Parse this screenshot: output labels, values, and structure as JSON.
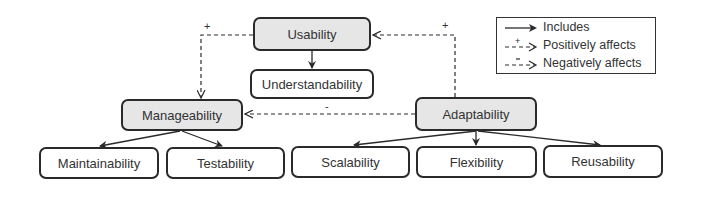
{
  "nodes": {
    "usability": {
      "label": "Usability",
      "filled": true
    },
    "understandability": {
      "label": "Understandability",
      "filled": false
    },
    "manageability": {
      "label": "Manageability",
      "filled": true
    },
    "adaptability": {
      "label": "Adaptability",
      "filled": true
    },
    "maintainability": {
      "label": "Maintainability",
      "filled": false
    },
    "testability": {
      "label": "Testability",
      "filled": false
    },
    "scalability": {
      "label": "Scalability",
      "filled": false
    },
    "flexibility": {
      "label": "Flexibility",
      "filled": false
    },
    "reusability": {
      "label": "Reusability",
      "filled": false
    }
  },
  "edges": [
    {
      "from": "usability",
      "to": "understandability",
      "type": "includes"
    },
    {
      "from": "manageability",
      "to": "maintainability",
      "type": "includes"
    },
    {
      "from": "manageability",
      "to": "testability",
      "type": "includes"
    },
    {
      "from": "adaptability",
      "to": "scalability",
      "type": "includes"
    },
    {
      "from": "adaptability",
      "to": "flexibility",
      "type": "includes"
    },
    {
      "from": "adaptability",
      "to": "reusability",
      "type": "includes"
    },
    {
      "from": "usability",
      "to": "manageability",
      "type": "positively_affects",
      "mark": "+"
    },
    {
      "from": "adaptability",
      "to": "usability",
      "type": "positively_affects",
      "mark": "+"
    },
    {
      "from": "adaptability",
      "to": "manageability",
      "type": "negatively_affects",
      "mark": "-"
    }
  ],
  "marks": {
    "plus": "+",
    "minus": "-"
  },
  "legend": {
    "includes": "Includes",
    "positive": "Positively affects",
    "negative": "Negatively affects"
  },
  "colors": {
    "filled_node": "#e6e6e6",
    "stroke": "#2a2a2a"
  }
}
